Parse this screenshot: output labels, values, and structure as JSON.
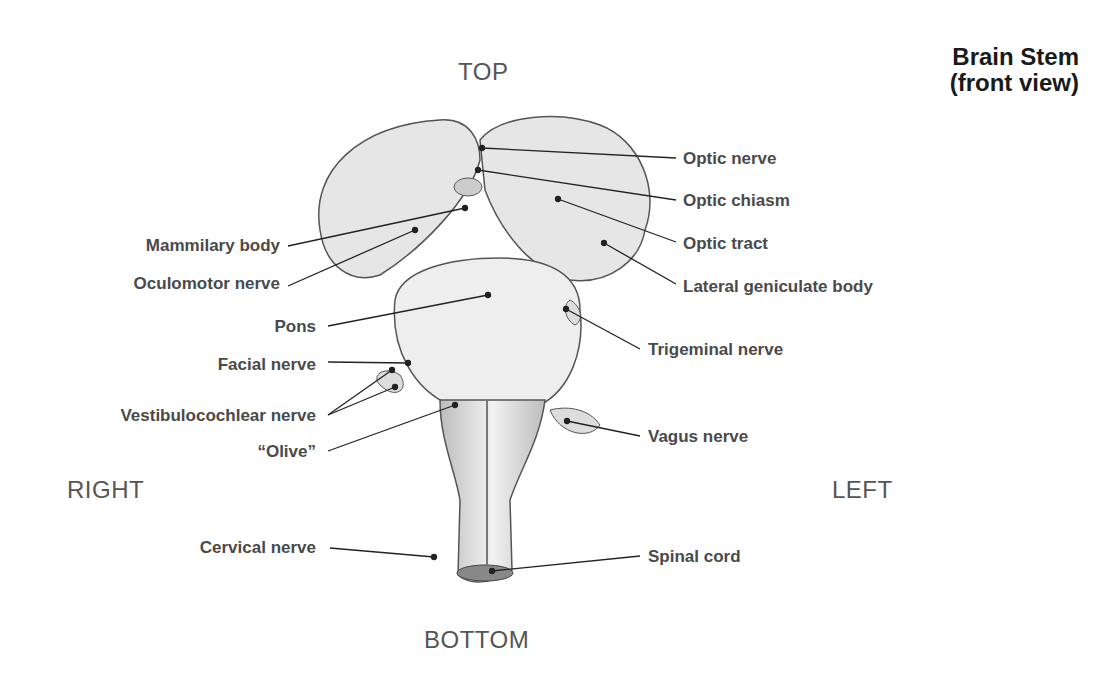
{
  "title": {
    "line1": "Brain Stem",
    "line2": "(front view)"
  },
  "directions": {
    "top": "TOP",
    "bottom": "BOTTOM",
    "right": "RIGHT",
    "left": "LEFT"
  },
  "labels_left": [
    {
      "text": "Mammilary body"
    },
    {
      "text": "Oculomotor nerve"
    },
    {
      "text": "Pons"
    },
    {
      "text": "Facial nerve"
    },
    {
      "text": "Vestibulocochlear nerve"
    },
    {
      "text": "“Olive”"
    },
    {
      "text": "Cervical nerve"
    }
  ],
  "labels_right": [
    {
      "text": "Optic nerve"
    },
    {
      "text": "Optic chiasm"
    },
    {
      "text": "Optic tract"
    },
    {
      "text": "Lateral geniculate body"
    },
    {
      "text": "Trigeminal nerve"
    },
    {
      "text": "Vagus nerve"
    },
    {
      "text": "Spinal cord"
    }
  ]
}
